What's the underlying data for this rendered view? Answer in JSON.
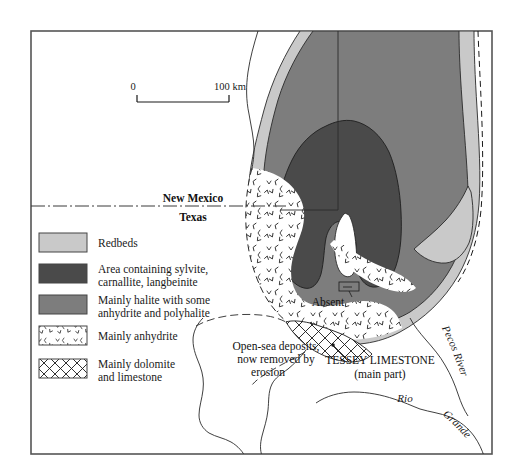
{
  "figure": {
    "kind": "geological-map",
    "frame_color": "#555555",
    "background": "#ffffff"
  },
  "scale_bar": {
    "start_label": "0",
    "end_label": "100 km"
  },
  "state_boundary": {
    "north_label": "New Mexico",
    "south_label": "Texas"
  },
  "legend": {
    "items": [
      {
        "key": "redbeds",
        "label": "Redbeds",
        "label_line2": "",
        "swatch": "solid",
        "color": "#c9c9c9"
      },
      {
        "key": "sylvite-zone",
        "label": "Area containing sylvite,",
        "label_line2": "carnallite, langbeinite",
        "swatch": "solid",
        "color": "#4a4a4a"
      },
      {
        "key": "halite",
        "label": "Mainly halite with some",
        "label_line2": "anhydrite and polyhalite",
        "swatch": "solid",
        "color": "#7d7d7d"
      },
      {
        "key": "anhydrite",
        "label": "Mainly anhydrite",
        "label_line2": "",
        "swatch": "tick-stipple",
        "color": "#ffffff"
      },
      {
        "key": "dolomite",
        "label": "Mainly dolomite",
        "label_line2": "and limestone",
        "swatch": "crosshatch",
        "color": "#ffffff"
      }
    ]
  },
  "map_labels": {
    "absent": "Absent",
    "open_sea_line1": "Open-sea deposits,",
    "open_sea_line2": "now removed by",
    "open_sea_line3": "erosion",
    "tessey_line1": "TESSEY LIMESTONE",
    "tessey_line2": "(main part)",
    "pecos_river": "Pecos River",
    "rio": "Rio",
    "grande": "Grande"
  },
  "colors": {
    "redbeds": "#c9c9c9",
    "halite": "#7d7d7d",
    "sylvite": "#4a4a4a",
    "white": "#ffffff",
    "line": "#222222",
    "frame": "#555555"
  }
}
